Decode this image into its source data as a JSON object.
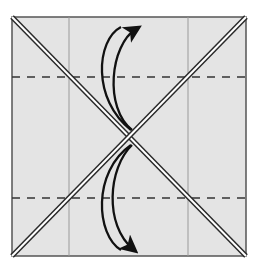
{
  "diagram": {
    "paper": {
      "x": 12,
      "y": 17,
      "width": 234,
      "height": 239,
      "fill": "#e4e4e4",
      "border": "#555555"
    },
    "vertical_creases": [
      {
        "x": 69,
        "color": "#9a9a9a"
      },
      {
        "x": 188,
        "color": "#9a9a9a"
      }
    ],
    "valley_folds_dashed": [
      {
        "y": 77,
        "color": "#333333"
      },
      {
        "y": 198,
        "color": "#333333"
      }
    ],
    "diagonal_folds": [
      {
        "from": [
          12,
          17
        ],
        "to": [
          246,
          256
        ]
      },
      {
        "from": [
          246,
          17
        ],
        "to": [
          12,
          256
        ]
      }
    ],
    "arrows": [
      {
        "name": "top-fold-arrow",
        "direction": "up",
        "description": "Curved double arrow showing fold movement upward"
      },
      {
        "name": "bottom-fold-arrow",
        "direction": "down",
        "description": "Curved double arrow showing fold movement downward"
      }
    ],
    "colors": {
      "paper": "#e4e4e4",
      "outline": "#555555",
      "diagonal_edge": "#2a2a2a",
      "arrow": "#111111"
    }
  }
}
